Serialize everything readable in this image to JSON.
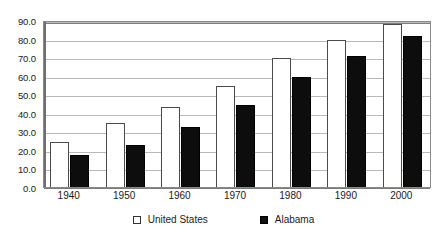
{
  "chart_data": {
    "type": "bar",
    "title": "",
    "subtitle": "",
    "xlabel": "",
    "ylabel": "",
    "categories": [
      "1940",
      "1950",
      "1960",
      "1970",
      "1980",
      "1990",
      "2000"
    ],
    "series": [
      {
        "name": "United States",
        "color": "#ffffff",
        "edge_color": "#4a4a4a",
        "values": [
          24.5,
          34.5,
          43.0,
          54.5,
          69.5,
          79.0,
          88.0
        ]
      },
      {
        "name": "Alabama",
        "color": "#0d0d0d",
        "edge_color": "#000000",
        "values": [
          17.0,
          22.5,
          32.5,
          44.0,
          59.5,
          70.5,
          81.5
        ]
      }
    ],
    "ylim": [
      0.0,
      90.0
    ],
    "yticks": [
      "0.0",
      "10.0",
      "20.0",
      "30.0",
      "40.0",
      "50.0",
      "60.0",
      "70.0",
      "80.0",
      "90.0"
    ],
    "ytick_values": [
      0.0,
      10.0,
      20.0,
      30.0,
      40.0,
      50.0,
      60.0,
      70.0,
      80.0,
      90.0
    ],
    "grid": true,
    "grid_axis": "y",
    "legend_position": "bottom",
    "legend": [
      "United States",
      "Alabama"
    ],
    "annotations": []
  },
  "legend": {
    "items": [
      {
        "label": "United States",
        "marker": "hollow-square-icon"
      },
      {
        "label": "Alabama",
        "marker": "filled-square-icon"
      }
    ]
  }
}
